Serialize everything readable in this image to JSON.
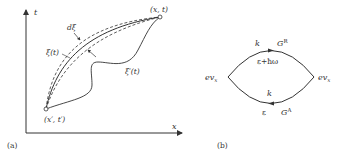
{
  "panel_a": {
    "label": "(a)",
    "axis_x": "x",
    "axis_y": "t",
    "start_point": "(x′, t′)",
    "end_point": "(x, t)",
    "classical_path": "ξ(t)",
    "fluctuating_path": "ξ′(t)",
    "width_label": "dξ"
  },
  "panel_b": {
    "label": "(b)",
    "left_vertex": "ev",
    "left_vertex_sub": "x",
    "right_vertex": "ev",
    "right_vertex_sub": "x",
    "top_momentum": "k",
    "top_green": "G",
    "top_green_sup": "R",
    "top_energy": "ε+ħω",
    "bottom_momentum": "k",
    "bottom_energy": "ε",
    "bottom_green": "G",
    "bottom_green_sup": "A"
  },
  "colors": {
    "line": "#333333",
    "background": "#ffffff"
  }
}
